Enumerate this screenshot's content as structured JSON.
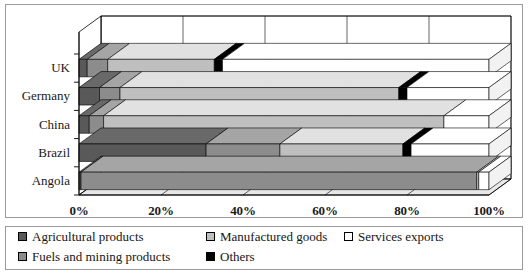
{
  "chart_data": {
    "type": "bar",
    "orientation": "horizontal",
    "stacked": true,
    "percent_stacked": true,
    "style": "3d",
    "title": "",
    "xlabel": "",
    "ylabel": "",
    "categories": [
      "UK",
      "Germany",
      "China",
      "Brazil",
      "Angola"
    ],
    "x_tick_labels": [
      "0%",
      "20%",
      "40%",
      "60%",
      "80%",
      "100%"
    ],
    "x_tick_values": [
      0,
      20,
      40,
      60,
      80,
      100
    ],
    "xlim": [
      0,
      100
    ],
    "grid": true,
    "legend_position": "bottom",
    "series": [
      {
        "name": "Agricultural products",
        "color": "#595959",
        "values": [
          2.0,
          5.0,
          2.5,
          31.0,
          0.5
        ]
      },
      {
        "name": "Fuels and mining products",
        "color": "#8c8c8c",
        "values": [
          5.0,
          5.0,
          3.5,
          18.0,
          96.5
        ]
      },
      {
        "name": "Manufactured goods",
        "color": "#bfbfbf",
        "values": [
          26.0,
          68.0,
          83.0,
          30.0,
          0.5
        ]
      },
      {
        "name": "Others",
        "color": "#000000",
        "values": [
          2.0,
          2.0,
          0.0,
          2.0,
          0.0
        ]
      },
      {
        "name": "Services exports",
        "color": "#ffffff",
        "values": [
          65.0,
          20.0,
          11.0,
          19.0,
          2.5
        ]
      }
    ],
    "legend_entries": [
      {
        "label": "Agricultural products",
        "color": "#595959"
      },
      {
        "label": "Manufactured goods",
        "color": "#bfbfbf"
      },
      {
        "label": "Services exports",
        "color": "#ffffff"
      },
      {
        "label": "Fuels and mining products",
        "color": "#8c8c8c"
      },
      {
        "label": "Others",
        "color": "#000000"
      }
    ]
  },
  "axis": {
    "tick0": "0%",
    "tick1": "20%",
    "tick2": "40%",
    "tick3": "60%",
    "tick4": "80%",
    "tick5": "100%"
  },
  "categories": {
    "c0": "UK",
    "c1": "Germany",
    "c2": "China",
    "c3": "Brazil",
    "c4": "Angola"
  },
  "legend": {
    "e0": "Agricultural products",
    "e1": "Manufactured goods",
    "e2": "Services exports",
    "e3": "Fuels and mining products",
    "e4": "Others"
  },
  "colors": {
    "agricultural": "#595959",
    "fuels": "#8c8c8c",
    "manufactured": "#bfbfbf",
    "others": "#000000",
    "services": "#ffffff",
    "wall": "#ffffff",
    "floor": "#e8e8e8",
    "border": "#9a9a9a",
    "outline": "#000000"
  }
}
